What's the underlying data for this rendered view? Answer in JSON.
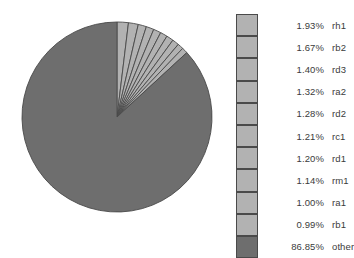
{
  "chart_data": {
    "type": "pie",
    "title": "",
    "subtitle": "",
    "xlabel": "",
    "ylabel": "",
    "legend_position": "right",
    "grid": false,
    "start_angle_deg": 0,
    "direction": "clockwise",
    "categories": [
      "rh1",
      "rb2",
      "rd3",
      "ra2",
      "rd2",
      "rc1",
      "rd1",
      "rm1",
      "ra1",
      "rb1",
      "other"
    ],
    "values": [
      1.93,
      1.67,
      1.4,
      1.32,
      1.28,
      1.21,
      1.2,
      1.14,
      1.0,
      0.99,
      86.85
    ],
    "value_labels": [
      "1.93%",
      "1.67%",
      "1.40%",
      "1.32%",
      "1.28%",
      "1.21%",
      "1.20%",
      "1.14%",
      "1.00%",
      "0.99%",
      "86.85%"
    ],
    "slice_colors": [
      "#b2b2b2",
      "#b2b2b2",
      "#b2b2b2",
      "#b2b2b2",
      "#b2b2b2",
      "#b2b2b2",
      "#b2b2b2",
      "#b2b2b2",
      "#b2b2b2",
      "#b2b2b2",
      "#6e6e6e"
    ],
    "slice_border_color": "#4a4a4a",
    "unit": "%"
  },
  "legend": {
    "rows": [
      {
        "pct": "1.93%",
        "label": "rh1",
        "color": "#b2b2b2"
      },
      {
        "pct": "1.67%",
        "label": "rb2",
        "color": "#b2b2b2"
      },
      {
        "pct": "1.40%",
        "label": "rd3",
        "color": "#b2b2b2"
      },
      {
        "pct": "1.32%",
        "label": "ra2",
        "color": "#b2b2b2"
      },
      {
        "pct": "1.28%",
        "label": "rd2",
        "color": "#b2b2b2"
      },
      {
        "pct": "1.21%",
        "label": "rc1",
        "color": "#b2b2b2"
      },
      {
        "pct": "1.20%",
        "label": "rd1",
        "color": "#b2b2b2"
      },
      {
        "pct": "1.14%",
        "label": "rm1",
        "color": "#b2b2b2"
      },
      {
        "pct": "1.00%",
        "label": "ra1",
        "color": "#b2b2b2"
      },
      {
        "pct": "0.99%",
        "label": "rb1",
        "color": "#b2b2b2"
      },
      {
        "pct": "86.85%",
        "label": "other",
        "color": "#6e6e6e"
      }
    ]
  },
  "pie_geometry": {
    "cx": 117,
    "cy": 117,
    "r": 95
  }
}
